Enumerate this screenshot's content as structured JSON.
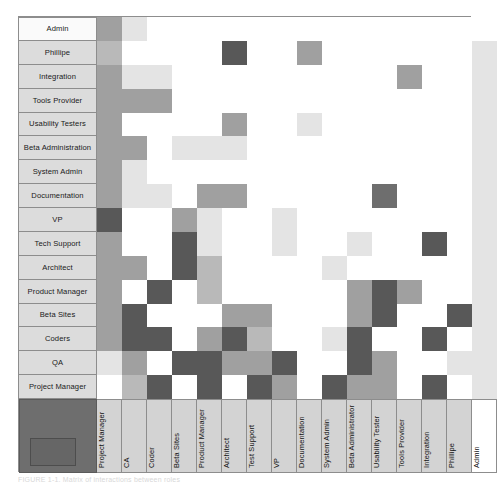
{
  "figure": {
    "type": "design-structure-matrix",
    "caption": "FIGURE 1-1.  Matrix of interactions between roles",
    "palette": {
      "empty": "#ffffff",
      "light": "#e4e4e4",
      "mid": "#b9b9b9",
      "medium": "#a0a0a0",
      "dark": "#6e6e6e",
      "darkest": "#585858",
      "label_bg": "#dcdcdc",
      "header_bg": "#d3d3d3",
      "corner_block": "#6e6e6e",
      "border": "#8d8d8d"
    }
  },
  "chart_data": {
    "type": "heatmap",
    "title": "Matrix of interactions between roles",
    "xlabel": "",
    "ylabel": "",
    "grid": true,
    "legend": "none",
    "row_labels": [
      "Admin",
      "Phillipe",
      "Integration",
      "Tools Provider",
      "Usability Testers",
      "Beta Administration",
      "System Admin",
      "Documentation",
      "VP",
      "Tech Support",
      "Architect",
      "Product Manager",
      "Beta Sites",
      "Coders",
      "QA",
      "Project Manager"
    ],
    "column_labels": [
      "Project Manager",
      "CA",
      "Coder",
      "Beta Sites",
      "Product Manager",
      "Architect",
      "Test Support",
      "VP",
      "Documentation",
      "System Admin",
      "Beta Administrator",
      "Usability Tester",
      "Tools Provider",
      "Integration",
      "Phillipe",
      "Admin"
    ],
    "value_scale": {
      "0": "#ffffff",
      "1": "#e4e4e4",
      "2": "#b9b9b9",
      "3": "#a0a0a0",
      "4": "#6e6e6e",
      "5": "#585858"
    },
    "values": [
      [
        3,
        1,
        0,
        0,
        0,
        0,
        0,
        0,
        0,
        0,
        0,
        0,
        0,
        0,
        0
      ],
      [
        2,
        0,
        0,
        0,
        0,
        5,
        0,
        0,
        3,
        0,
        0,
        0,
        0,
        0,
        0
      ],
      [
        3,
        1,
        1,
        0,
        0,
        0,
        0,
        0,
        0,
        0,
        0,
        0,
        3,
        0,
        0
      ],
      [
        3,
        3,
        3,
        0,
        0,
        0,
        0,
        0,
        0,
        0,
        0,
        0,
        0,
        0,
        0
      ],
      [
        3,
        0,
        0,
        0,
        0,
        3,
        0,
        0,
        1,
        0,
        0,
        0,
        0,
        0,
        0
      ],
      [
        3,
        3,
        0,
        1,
        1,
        1,
        0,
        0,
        0,
        0,
        0,
        0,
        0,
        0,
        0
      ],
      [
        3,
        1,
        0,
        0,
        0,
        0,
        0,
        0,
        0,
        0,
        0,
        0,
        0,
        0,
        0
      ],
      [
        3,
        1,
        1,
        0,
        3,
        3,
        0,
        0,
        0,
        0,
        0,
        4,
        0,
        0,
        0
      ],
      [
        5,
        0,
        0,
        3,
        1,
        0,
        0,
        1,
        0,
        0,
        0,
        0,
        0,
        0,
        0
      ],
      [
        3,
        0,
        0,
        5,
        1,
        0,
        0,
        1,
        0,
        0,
        1,
        0,
        0,
        5,
        0
      ],
      [
        3,
        3,
        0,
        5,
        2,
        0,
        0,
        0,
        0,
        1,
        0,
        0,
        0,
        0,
        0
      ],
      [
        3,
        0,
        5,
        0,
        2,
        0,
        0,
        0,
        0,
        0,
        3,
        5,
        3,
        0,
        0
      ],
      [
        3,
        5,
        0,
        0,
        0,
        3,
        3,
        0,
        0,
        0,
        3,
        5,
        0,
        0,
        5,
        0
      ],
      [
        3,
        5,
        5,
        0,
        3,
        5,
        2,
        0,
        0,
        1,
        5,
        0,
        0,
        5,
        0
      ],
      [
        1,
        3,
        0,
        5,
        5,
        3,
        3,
        5,
        0,
        0,
        5,
        3,
        0,
        0,
        1
      ],
      [
        0,
        2,
        5,
        0,
        5,
        0,
        5,
        3,
        0,
        5,
        3,
        3,
        0,
        5,
        0
      ]
    ],
    "last_column_value": "1",
    "note": "Column 16 (Admin) is uniformly light across all rows"
  }
}
